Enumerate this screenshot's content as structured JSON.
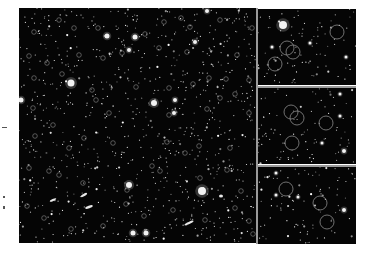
{
  "figure": {
    "background_color": "#050505",
    "circle_color": "#8c8c8c",
    "divider_color": "#9a9a9a",
    "main_field": {
      "bright_sources": [
        {
          "x": 52,
          "y": 75,
          "r": 3.5
        },
        {
          "x": 88,
          "y": 28,
          "r": 2.5
        },
        {
          "x": 116,
          "y": 29,
          "r": 2.5
        },
        {
          "x": 110,
          "y": 42,
          "r": 2
        },
        {
          "x": 135,
          "y": 95,
          "r": 3
        },
        {
          "x": 155,
          "y": 105,
          "r": 2
        },
        {
          "x": 176,
          "y": 34,
          "r": 2
        },
        {
          "x": 188,
          "y": 3,
          "r": 2
        },
        {
          "x": 110,
          "y": 177,
          "r": 3
        },
        {
          "x": 183,
          "y": 183,
          "r": 4
        },
        {
          "x": 127,
          "y": 225,
          "r": 2.5
        },
        {
          "x": 114,
          "y": 225,
          "r": 2.5
        },
        {
          "x": 156,
          "y": 92,
          "r": 2
        },
        {
          "x": 2,
          "y": 92,
          "r": 2.5
        },
        {
          "x": 250,
          "y": 130,
          "r": 3
        }
      ],
      "elongated_sources": [
        {
          "x": 65,
          "y": 187,
          "w": 7,
          "h": 2.5,
          "angle": -30
        },
        {
          "x": 34,
          "y": 192,
          "w": 7,
          "h": 2,
          "angle": -25
        },
        {
          "x": 70,
          "y": 199,
          "w": 8,
          "h": 2.5,
          "angle": -20
        },
        {
          "x": 170,
          "y": 215,
          "w": 10,
          "h": 2,
          "angle": -25
        },
        {
          "x": 202,
          "y": 188,
          "w": 4,
          "h": 3,
          "angle": 0
        }
      ],
      "circles": [
        {
          "x": 15,
          "y": 24
        },
        {
          "x": 40,
          "y": 12
        },
        {
          "x": 55,
          "y": 20
        },
        {
          "x": 79,
          "y": 20
        },
        {
          "x": 126,
          "y": 26
        },
        {
          "x": 145,
          "y": 14
        },
        {
          "x": 162,
          "y": 10
        },
        {
          "x": 171,
          "y": 19
        },
        {
          "x": 201,
          "y": 12
        },
        {
          "x": 233,
          "y": 20
        },
        {
          "x": 10,
          "y": 48
        },
        {
          "x": 28,
          "y": 55
        },
        {
          "x": 60,
          "y": 47
        },
        {
          "x": 84,
          "y": 50
        },
        {
          "x": 103,
          "y": 45
        },
        {
          "x": 140,
          "y": 40
        },
        {
          "x": 168,
          "y": 44
        },
        {
          "x": 218,
          "y": 47
        },
        {
          "x": 240,
          "y": 35
        },
        {
          "x": 15,
          "y": 70
        },
        {
          "x": 43,
          "y": 66
        },
        {
          "x": 73,
          "y": 82
        },
        {
          "x": 117,
          "y": 79
        },
        {
          "x": 150,
          "y": 80
        },
        {
          "x": 174,
          "y": 76
        },
        {
          "x": 190,
          "y": 70
        },
        {
          "x": 207,
          "y": 71
        },
        {
          "x": 230,
          "y": 72
        },
        {
          "x": 14,
          "y": 100
        },
        {
          "x": 34,
          "y": 117
        },
        {
          "x": 77,
          "y": 92
        },
        {
          "x": 90,
          "y": 105
        },
        {
          "x": 150,
          "y": 107
        },
        {
          "x": 188,
          "y": 101
        },
        {
          "x": 201,
          "y": 90
        },
        {
          "x": 216,
          "y": 86
        },
        {
          "x": 230,
          "y": 105
        },
        {
          "x": 16,
          "y": 128
        },
        {
          "x": 50,
          "y": 140
        },
        {
          "x": 65,
          "y": 130
        },
        {
          "x": 94,
          "y": 135
        },
        {
          "x": 133,
          "y": 158
        },
        {
          "x": 148,
          "y": 134
        },
        {
          "x": 166,
          "y": 145
        },
        {
          "x": 180,
          "y": 138
        },
        {
          "x": 211,
          "y": 140
        },
        {
          "x": 10,
          "y": 160
        },
        {
          "x": 30,
          "y": 163
        },
        {
          "x": 40,
          "y": 167
        },
        {
          "x": 64,
          "y": 175
        },
        {
          "x": 108,
          "y": 182
        },
        {
          "x": 141,
          "y": 163
        },
        {
          "x": 181,
          "y": 170
        },
        {
          "x": 208,
          "y": 162
        },
        {
          "x": 222,
          "y": 183
        },
        {
          "x": 8,
          "y": 198
        },
        {
          "x": 25,
          "y": 210
        },
        {
          "x": 52,
          "y": 221
        },
        {
          "x": 84,
          "y": 218
        },
        {
          "x": 107,
          "y": 196
        },
        {
          "x": 125,
          "y": 208
        },
        {
          "x": 154,
          "y": 202
        },
        {
          "x": 186,
          "y": 212
        },
        {
          "x": 216,
          "y": 200
        },
        {
          "x": 230,
          "y": 213
        },
        {
          "x": 234,
          "y": 226
        }
      ]
    },
    "insets": [
      {
        "id": "inset-1",
        "bright_sources": [
          {
            "x": 25,
            "y": 16,
            "r": 4
          },
          {
            "x": 14,
            "y": 38,
            "r": 1.5
          },
          {
            "x": 52,
            "y": 34,
            "r": 1.5
          },
          {
            "x": 88,
            "y": 48,
            "r": 1.5
          }
        ],
        "circles": [
          {
            "x": 29,
            "y": 39,
            "r": 7
          },
          {
            "x": 35,
            "y": 43,
            "r": 7
          },
          {
            "x": 17,
            "y": 55,
            "r": 7
          },
          {
            "x": 79,
            "y": 23,
            "r": 7
          }
        ]
      },
      {
        "id": "inset-2",
        "bright_sources": [
          {
            "x": 82,
            "y": 6,
            "r": 1.5
          },
          {
            "x": 82,
            "y": 28,
            "r": 1.5
          },
          {
            "x": 86,
            "y": 63,
            "r": 2
          },
          {
            "x": 64,
            "y": 55,
            "r": 1.5
          }
        ],
        "circles": [
          {
            "x": 33,
            "y": 24,
            "r": 7
          },
          {
            "x": 39,
            "y": 30,
            "r": 7
          },
          {
            "x": 68,
            "y": 35,
            "r": 7
          },
          {
            "x": 34,
            "y": 55,
            "r": 7
          }
        ]
      },
      {
        "id": "inset-3",
        "bright_sources": [
          {
            "x": 18,
            "y": 6,
            "r": 1.5
          },
          {
            "x": 18,
            "y": 28,
            "r": 1.5
          },
          {
            "x": 86,
            "y": 43,
            "r": 2
          },
          {
            "x": 40,
            "y": 30,
            "r": 1.5
          }
        ],
        "circles": [
          {
            "x": 28,
            "y": 22,
            "r": 7
          },
          {
            "x": 62,
            "y": 36,
            "r": 7
          },
          {
            "x": 69,
            "y": 55,
            "r": 7
          }
        ]
      }
    ]
  }
}
